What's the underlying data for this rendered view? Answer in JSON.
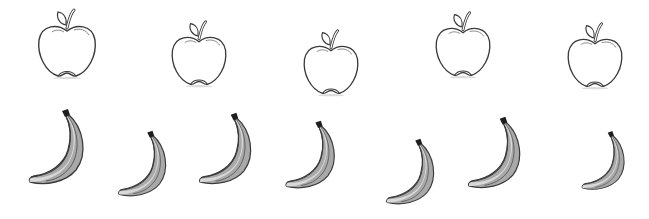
{
  "scene": {
    "background": "#ffffff",
    "apples": [
      {
        "label": "apple",
        "x": 36,
        "y": 6,
        "w": 62,
        "h": 76
      },
      {
        "label": "apple",
        "x": 168,
        "y": 18,
        "w": 62,
        "h": 72
      },
      {
        "label": "apple",
        "x": 300,
        "y": 27,
        "w": 62,
        "h": 72
      },
      {
        "label": "apple",
        "x": 432,
        "y": 9,
        "w": 62,
        "h": 72
      },
      {
        "label": "apple",
        "x": 564,
        "y": 20,
        "w": 62,
        "h": 72
      }
    ],
    "bananas": [
      {
        "label": "banana",
        "x": 24,
        "y": 106,
        "w": 64,
        "h": 80,
        "rot": 0
      },
      {
        "label": "banana",
        "x": 114,
        "y": 122,
        "w": 56,
        "h": 82,
        "rot": 0
      },
      {
        "label": "banana",
        "x": 190,
        "y": 110,
        "w": 70,
        "h": 76,
        "rot": 0
      },
      {
        "label": "banana",
        "x": 274,
        "y": 118,
        "w": 72,
        "h": 72,
        "rot": 0
      },
      {
        "label": "banana",
        "x": 382,
        "y": 130,
        "w": 56,
        "h": 82,
        "rot": 0
      },
      {
        "label": "banana",
        "x": 460,
        "y": 114,
        "w": 68,
        "h": 76,
        "rot": 0
      },
      {
        "label": "banana",
        "x": 578,
        "y": 120,
        "w": 50,
        "h": 80,
        "rot": 0
      }
    ],
    "colors": {
      "outline": "#3a3a3a",
      "banana_light": "#d9d9d9",
      "banana_dark": "#a9a9a9",
      "stem": "#1e1e1e"
    }
  }
}
